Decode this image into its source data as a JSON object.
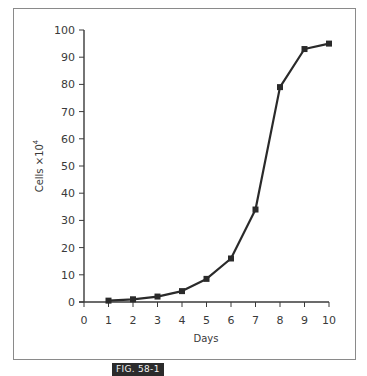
{
  "figure_label": "FIG. 58-1",
  "colors": {
    "line": "#2a2a2a",
    "axis": "#3a3a3a",
    "frame": "#8a8a8a",
    "label_bg": "#2b2b2b"
  },
  "chart_data": {
    "type": "line",
    "title": "",
    "xlabel": "Days",
    "ylabel": "Cells ×10⁴",
    "ylabel_base": "Cells ×10",
    "ylabel_exp": "4",
    "x": [
      1,
      2,
      3,
      4,
      5,
      6,
      7,
      8,
      9,
      10
    ],
    "series": [
      {
        "name": "Cells",
        "marker": "square",
        "values": [
          0.5,
          1,
          2,
          4,
          8.5,
          16,
          34,
          79,
          93,
          95
        ]
      }
    ],
    "xlim": [
      0,
      10
    ],
    "ylim": [
      0,
      100
    ],
    "xticks": [
      0,
      1,
      2,
      3,
      4,
      5,
      6,
      7,
      8,
      9,
      10
    ],
    "yticks": [
      0,
      10,
      20,
      30,
      40,
      50,
      60,
      70,
      80,
      90,
      100
    ],
    "grid": false,
    "legend": "none"
  }
}
